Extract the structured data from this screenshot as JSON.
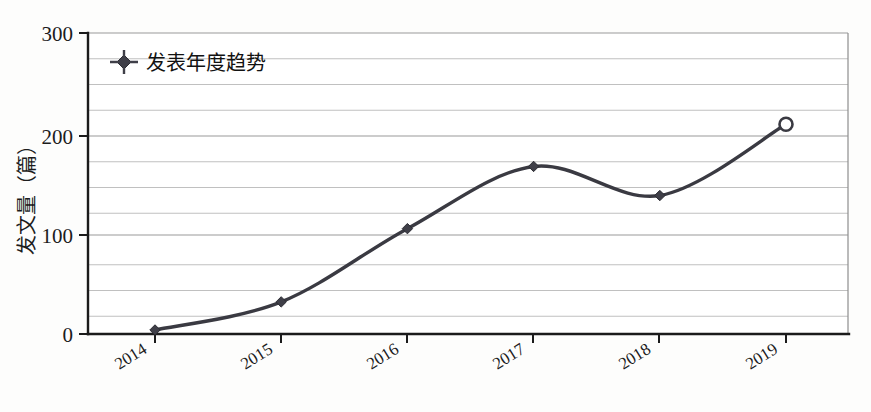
{
  "chart_data": {
    "type": "line",
    "title": "",
    "xlabel": "",
    "ylabel": "发文量（篇）",
    "categories": [
      "2014",
      "2015",
      "2016",
      "2017",
      "2018",
      "2019"
    ],
    "series": [
      {
        "name": "发表年度趋势",
        "values": [
          4,
          32,
          105,
          167,
          138,
          209
        ],
        "marker": "diamond",
        "last_point_marker": "open-circle",
        "color": "#3a3a42",
        "smooth": true
      }
    ],
    "ylim": [
      0,
      300
    ],
    "y_major_ticks": [
      0,
      100,
      200,
      300
    ],
    "y_minor_interval": 25,
    "y_tick_labels": [
      "0",
      "100",
      "200",
      "300"
    ],
    "grid": true,
    "grid_axis": "y",
    "legend_position": "top-left",
    "x_tick_rotation_deg": -32
  },
  "legend": {
    "entries": [
      {
        "label": "发表年度趋势",
        "marker_icon": "diamond-marker-icon"
      }
    ]
  },
  "axes": {
    "y_axis_title": "发文量（篇）",
    "y_tick_labels": [
      "300",
      "200",
      "100",
      "0"
    ],
    "x_tick_labels": [
      "2014",
      "2015",
      "2016",
      "2017",
      "2018",
      "2019"
    ]
  },
  "colors": {
    "series": "#3a3a42",
    "grid_minor": "#b9b9b9",
    "grid_major": "#9a9a9a",
    "axis": "#1b1b1b",
    "background": "#fdfdfc",
    "text": "#1c1c1c"
  }
}
